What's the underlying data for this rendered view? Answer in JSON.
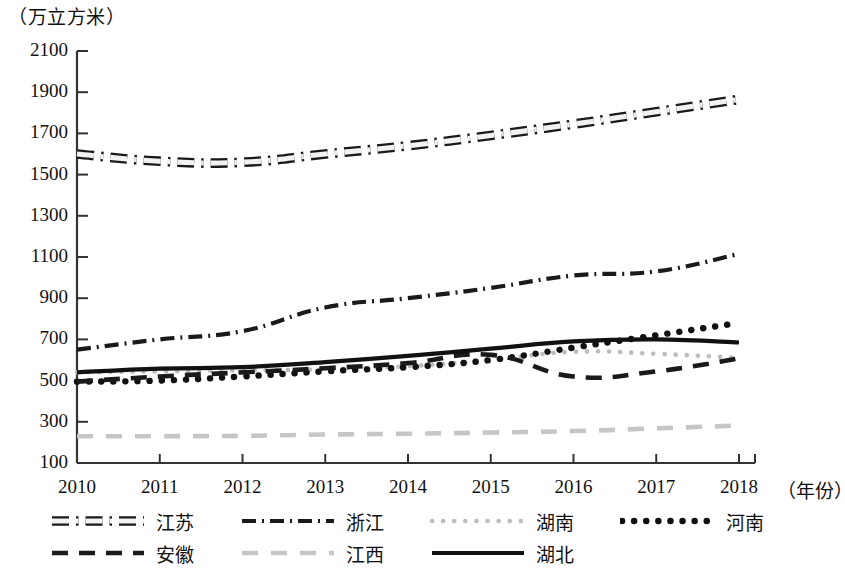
{
  "chart_data": {
    "type": "line",
    "title": "",
    "unit_label": "（万立方米）",
    "xlabel": "（年份）",
    "ylabel": "",
    "categories": [
      2010,
      2011,
      2012,
      2013,
      2014,
      2015,
      2016,
      2017,
      2018
    ],
    "x_tick_labels": [
      "2010",
      "2011",
      "2012",
      "2013",
      "2014",
      "2015",
      "2016",
      "2017",
      "2018"
    ],
    "y_tick_labels": [
      "2100",
      "1900",
      "1700",
      "1500",
      "1300",
      "1100",
      "900",
      "700",
      "500",
      "300",
      "100"
    ],
    "ylim": [
      100,
      2100
    ],
    "y_step": 200,
    "xlim": [
      2010,
      2018
    ],
    "grid": false,
    "legend_position": "bottom",
    "series": [
      {
        "name": "江苏",
        "style": "dash-dot-outline",
        "color": "#1a1a1a",
        "values": [
          1600,
          1565,
          1560,
          1600,
          1640,
          1690,
          1745,
          1805,
          1865
        ]
      },
      {
        "name": "浙江",
        "style": "dash-dot",
        "color": "#1a1a1a",
        "values": [
          650,
          700,
          740,
          855,
          900,
          950,
          1010,
          1030,
          1115
        ]
      },
      {
        "name": "湖南",
        "style": "dotted-light",
        "color": "#b5b5b5",
        "values": [
          540,
          545,
          550,
          555,
          570,
          600,
          640,
          630,
          610
        ]
      },
      {
        "name": "河南",
        "style": "dotted-bold",
        "color": "#111111",
        "values": [
          495,
          500,
          520,
          545,
          565,
          600,
          660,
          720,
          780
        ]
      },
      {
        "name": "安徽",
        "style": "dashed",
        "color": "#1a1a1a",
        "values": [
          495,
          520,
          540,
          560,
          585,
          625,
          520,
          545,
          608
        ]
      },
      {
        "name": "江西",
        "style": "dashed-light",
        "color": "#c2c2c2",
        "values": [
          230,
          230,
          232,
          238,
          242,
          248,
          255,
          268,
          282
        ]
      },
      {
        "name": "湖北",
        "style": "solid-thick",
        "color": "#111111",
        "values": [
          540,
          558,
          565,
          590,
          620,
          655,
          690,
          700,
          685
        ]
      }
    ]
  },
  "axis": {
    "y_title": "（万立方米）",
    "x_title": "（年份）"
  },
  "legend": {
    "items": [
      {
        "label": "江苏",
        "style": "dash-dot-outline"
      },
      {
        "label": "浙江",
        "style": "dash-dot"
      },
      {
        "label": "湖南",
        "style": "dotted-light"
      },
      {
        "label": "河南",
        "style": "dotted-bold"
      },
      {
        "label": "安徽",
        "style": "dashed"
      },
      {
        "label": "江西",
        "style": "dashed-light"
      },
      {
        "label": "湖北",
        "style": "solid-thick"
      }
    ]
  }
}
